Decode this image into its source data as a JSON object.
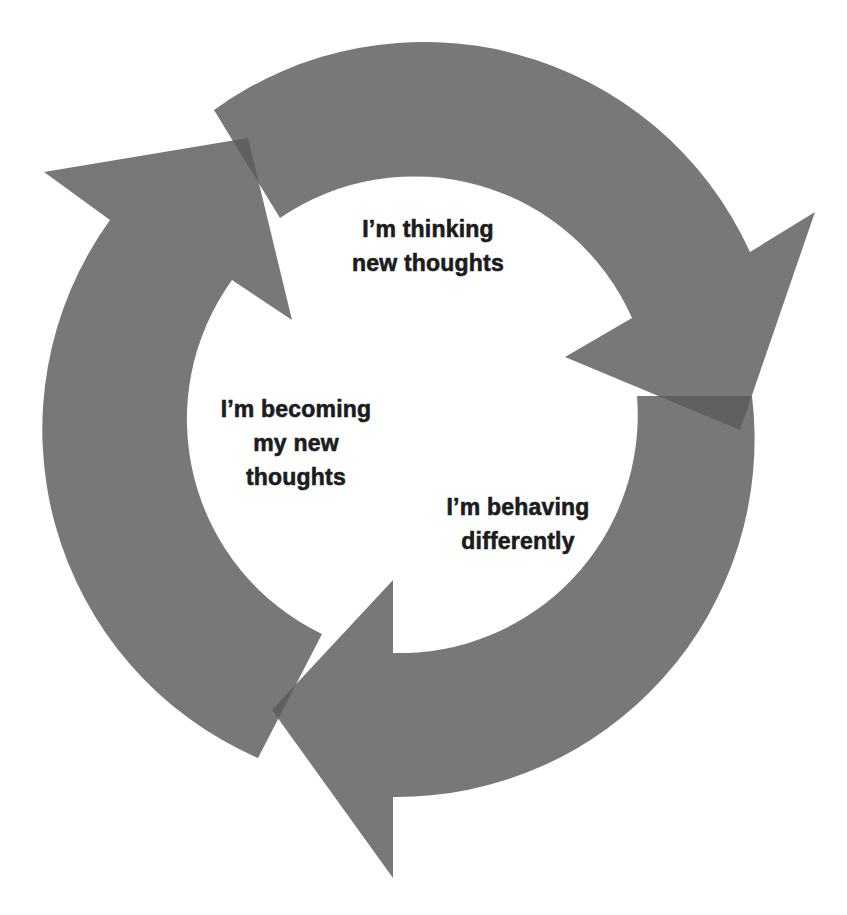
{
  "diagram": {
    "type": "cycle",
    "direction": "clockwise",
    "colors": {
      "background": "#ffffff",
      "arrow_fill": "#5a5a5a",
      "arrow_opacity": 0.82,
      "overlap": "#2e2e2e",
      "text": "#1c1c1c"
    },
    "stages": [
      {
        "id": "thinking",
        "lines": [
          "I’m thinking",
          "new thoughts"
        ]
      },
      {
        "id": "behaving",
        "lines": [
          "I’m behaving",
          "differently"
        ]
      },
      {
        "id": "becoming",
        "lines": [
          "I’m becoming",
          "my new",
          "thoughts"
        ]
      }
    ]
  }
}
